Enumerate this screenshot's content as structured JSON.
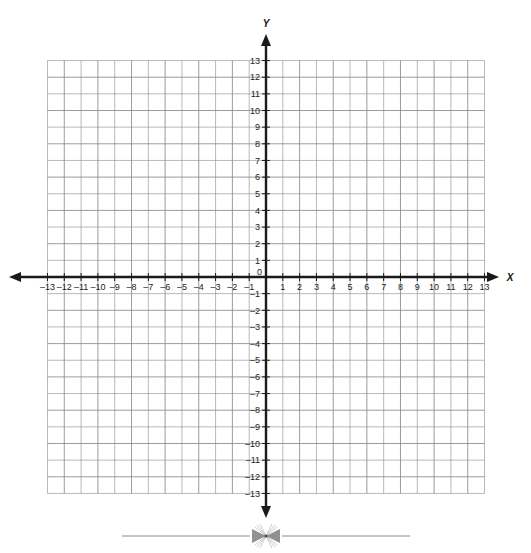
{
  "chart_data": {
    "type": "scatter",
    "title": "",
    "subtitle": "",
    "xlabel": "X",
    "ylabel": "Y",
    "xlim": [
      -13,
      13
    ],
    "ylim": [
      -13,
      13
    ],
    "grid": true,
    "legend": "none",
    "series": [],
    "x_tick_labels": [
      "–13",
      "–12",
      "–11",
      "–10",
      "–9",
      "–8",
      "–7",
      "–6",
      "–5",
      "–4",
      "–3",
      "–2",
      "–1",
      "1",
      "2",
      "3",
      "4",
      "5",
      "6",
      "7",
      "8",
      "9",
      "10",
      "11",
      "12",
      "13"
    ],
    "x_tick_values": [
      -13,
      -12,
      -11,
      -10,
      -9,
      -8,
      -7,
      -6,
      -5,
      -4,
      -3,
      -2,
      -1,
      1,
      2,
      3,
      4,
      5,
      6,
      7,
      8,
      9,
      10,
      11,
      12,
      13
    ],
    "y_tick_labels": [
      "13",
      "12",
      "11",
      "10",
      "9",
      "8",
      "7",
      "6",
      "5",
      "4",
      "3",
      "2",
      "1",
      "–1",
      "–2",
      "–3",
      "–4",
      "–5",
      "–6",
      "–7",
      "–8",
      "–9",
      "–10",
      "–11",
      "–12",
      "–13"
    ],
    "y_tick_values": [
      13,
      12,
      11,
      10,
      9,
      8,
      7,
      6,
      5,
      4,
      3,
      2,
      1,
      -1,
      -2,
      -3,
      -4,
      -5,
      -6,
      -7,
      -8,
      -9,
      -10,
      -11,
      -12,
      -13
    ],
    "origin_label": "0",
    "gridline_interval": 1,
    "data_points": []
  },
  "graph": {
    "x_axis_label": "X",
    "y_axis_label": "Y",
    "origin_label": "0",
    "x_axis_name": "x-axis",
    "y_axis_name": "y-axis",
    "arrow_left_name": "x-axis-left-arrow",
    "arrow_right_name": "x-axis-right-arrow",
    "arrow_up_name": "y-axis-up-arrow",
    "arrow_down_name": "y-axis-down-arrow"
  },
  "colors": {
    "grid_line": "#8a8a8a",
    "grid_line_light": "#b4b4b4",
    "axis": "#1a1a1a",
    "text": "#222222",
    "background": "#ffffff",
    "ornament": "#8c8c8c"
  },
  "footer": {
    "ornament_name": "decorative-divider-ornament",
    "ornament_glyph": "❧"
  }
}
